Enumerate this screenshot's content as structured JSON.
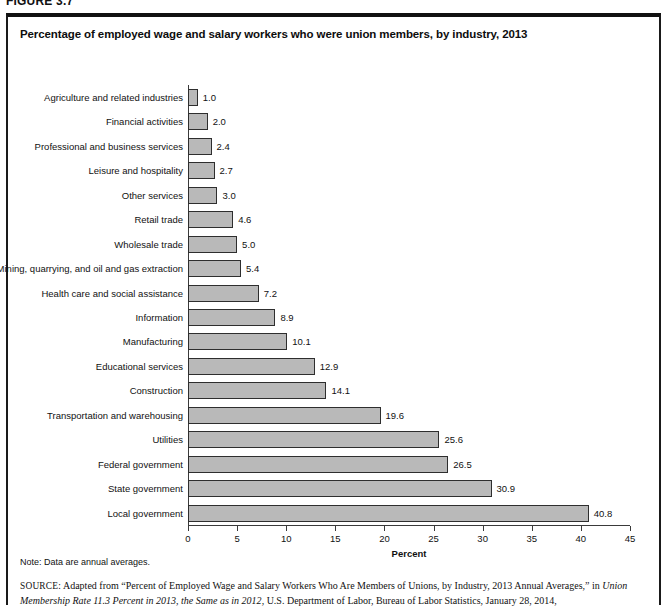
{
  "figure": {
    "number": "FIGURE 3.7"
  },
  "panel": {
    "title": "Percentage of employed wage and salary workers who were union members, by industry, 2013"
  },
  "notes": {
    "note": "Note: Data are annual averages.",
    "source_label": "SOURCE:",
    "source_part1": " Adapted from “Percent of Employed Wage and Salary Workers Who Are Members of Unions, by Industry, 2013 Annual Averages,” in ",
    "source_italic1": "Union Membership Rate 11.3 Percent in 2013, the Same as in 2012",
    "source_part2": ", U.S. Department of Labor, Bureau of Labor Statistics, January 28, 2014, http://www.bls.gov/opub/ted/2014/ted_20140128.htm (accessed August 29, 2014)"
  },
  "colors": {
    "bar_fill": "#b9b9b9",
    "bar_stroke": "#2e2e2e",
    "axis": "#3a3a3a",
    "panel_border": "#1a1a1a"
  },
  "chart_data": {
    "type": "bar",
    "orientation": "horizontal",
    "title": "Percentage of employed wage and salary workers who were union members, by industry, 2013",
    "xlabel": "Percent",
    "ylabel": "",
    "xlim": [
      0,
      45
    ],
    "xticks": [
      0,
      5,
      10,
      15,
      20,
      25,
      30,
      35,
      40,
      45
    ],
    "grid": false,
    "legend": false,
    "categories": [
      "Agriculture and related industries",
      "Financial activities",
      "Professional and business services",
      "Leisure and hospitality",
      "Other services",
      "Retail trade",
      "Wholesale trade",
      "Mining, quarrying, and oil and gas extraction",
      "Health care and social assistance",
      "Information",
      "Manufacturing",
      "Educational services",
      "Construction",
      "Transportation and warehousing",
      "Utilities",
      "Federal government",
      "State government",
      "Local government"
    ],
    "values": [
      1.0,
      2.0,
      2.4,
      2.7,
      3.0,
      4.6,
      5.0,
      5.4,
      7.2,
      8.9,
      10.1,
      12.9,
      14.1,
      19.6,
      25.6,
      26.5,
      30.9,
      40.8
    ],
    "value_labels": [
      "1.0",
      "2.0",
      "2.4",
      "2.7",
      "3.0",
      "4.6",
      "5.0",
      "5.4",
      "7.2",
      "8.9",
      "10.1",
      "12.9",
      "14.1",
      "19.6",
      "25.6",
      "26.5",
      "30.9",
      "40.8"
    ]
  }
}
